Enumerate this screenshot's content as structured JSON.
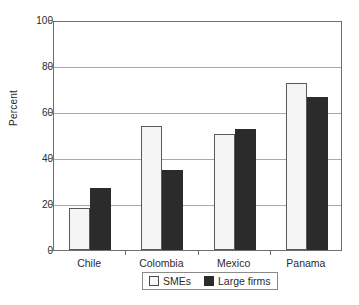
{
  "chart_data": {
    "type": "bar",
    "title": "",
    "subtitle": "",
    "xlabel": "",
    "ylabel": "Percent",
    "ylim": [
      0,
      100
    ],
    "yticks": [
      0,
      20,
      40,
      60,
      80,
      100
    ],
    "ytick_labels": [
      "0",
      "20",
      "40",
      "60",
      "80",
      "100"
    ],
    "grid": "horizontal",
    "legend_position": "bottom-center",
    "categories": [
      "Chile",
      "Colombia",
      "Mexico",
      "Panama"
    ],
    "series": [
      {
        "name": "SMEs",
        "color": "#f5f5f5",
        "edge_color": "#595959",
        "values": [
          18.3,
          54.0,
          50.5,
          72.5
        ]
      },
      {
        "name": "Large firms",
        "color": "#2b2b2b",
        "edge_color": "#2b2b2b",
        "values": [
          27.0,
          35.0,
          52.5,
          66.5
        ]
      }
    ],
    "annotations": []
  },
  "axes": {
    "y_title": "Percent",
    "ticks": [
      {
        "label": "100",
        "value": 100
      },
      {
        "label": "80",
        "value": 80
      },
      {
        "label": "60",
        "value": 60
      },
      {
        "label": "40",
        "value": 40
      },
      {
        "label": "20",
        "value": 20
      },
      {
        "label": "0",
        "value": 0
      }
    ]
  },
  "categories": [
    {
      "label": "Chile"
    },
    {
      "label": "Colombia"
    },
    {
      "label": "Mexico"
    },
    {
      "label": "Panama"
    }
  ],
  "legend": {
    "items": [
      {
        "label": "SMEs",
        "style": "smes"
      },
      {
        "label": "Large firms",
        "style": "large"
      }
    ]
  }
}
